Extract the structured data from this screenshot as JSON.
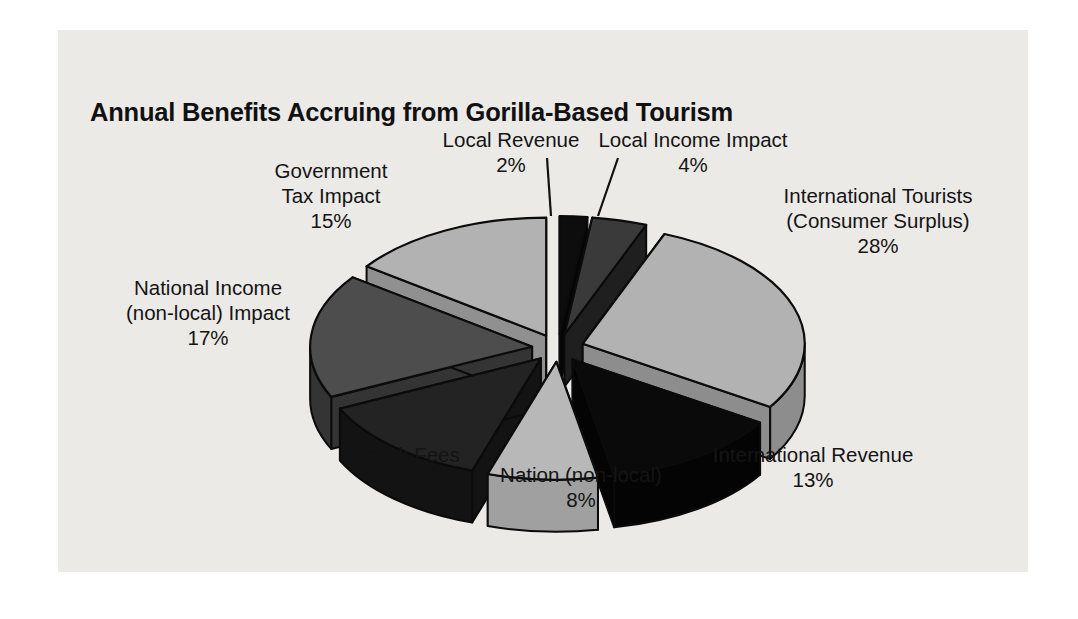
{
  "figure": {
    "title": "Annual Benefits Accruing from Gorilla-Based Tourism",
    "panel_background": "#eceae7",
    "page_background": "#ffffff"
  },
  "chart_data": {
    "type": "pie",
    "title": "Annual Benefits Accruing from Gorilla-Based Tourism",
    "subtitle": "",
    "xlabel": "",
    "ylabel": "",
    "style": "3d-exploded",
    "legend_position": "none",
    "grid": false,
    "value_unit": "%",
    "total": 100,
    "categories": [
      "Local Revenue",
      "Local Income Impact",
      "International Tourists (Consumer Surplus)",
      "International Revenue",
      "Nation (non-local)",
      "Park Fees",
      "National Income (non-local) Impact",
      "Government Tax Impact"
    ],
    "values": [
      2,
      4,
      28,
      13,
      8,
      13,
      17,
      15
    ],
    "slices": [
      {
        "name": "local-revenue",
        "label": "Local Revenue",
        "label_line1": "Local Revenue",
        "label_line2": "",
        "percent": "2%",
        "value": 2,
        "color": "#0d0d0d",
        "side_color": "#050505",
        "leader_line": true
      },
      {
        "name": "local-income-impact",
        "label": "Local Income Impact",
        "label_line1": "Local Income Impact",
        "label_line2": "",
        "percent": "4%",
        "value": 4,
        "color": "#3a3a3a",
        "side_color": "#1f1f1f",
        "leader_line": true
      },
      {
        "name": "international-tourists",
        "label": "International Tourists (Consumer Surplus)",
        "label_line1": "International Tourists",
        "label_line2": "(Consumer Surplus)",
        "percent": "28%",
        "value": 28,
        "color": "#b2b2b2",
        "side_color": "#8d8d8d",
        "leader_line": false
      },
      {
        "name": "international-revenue",
        "label": "International Revenue",
        "label_line1": "International Revenue",
        "label_line2": "",
        "percent": "13%",
        "value": 13,
        "color": "#0a0a0a",
        "side_color": "#040404",
        "leader_line": false
      },
      {
        "name": "nation-non-local",
        "label": "Nation (non-local)",
        "label_line1": "Nation (non-local)",
        "label_line2": "",
        "percent": "8%",
        "value": 8,
        "color": "#b8b8b8",
        "side_color": "#a0a0a0",
        "leader_line": false
      },
      {
        "name": "park-fees",
        "label": "Park Fees",
        "label_line1": "Park Fees",
        "label_line2": "",
        "percent": "13%",
        "value": 13,
        "color": "#232323",
        "side_color": "#131313",
        "leader_line": false
      },
      {
        "name": "national-income-non-local-impact",
        "label": "National Income (non-local) Impact",
        "label_line1": "National Income",
        "label_line2": "(non-local) Impact",
        "percent": "17%",
        "value": 17,
        "color": "#4d4d4d",
        "side_color": "#343434",
        "leader_line": false
      },
      {
        "name": "government-tax-impact",
        "label": "Government Tax Impact",
        "label_line1": "Government",
        "label_line2": "Tax Impact",
        "percent": "15%",
        "value": 15,
        "color": "#b2b2b2",
        "side_color": "#909090",
        "leader_line": false
      }
    ]
  }
}
